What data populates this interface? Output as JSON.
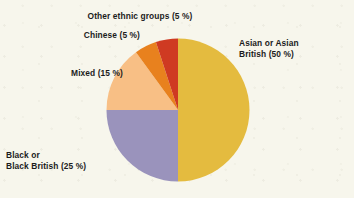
{
  "figure": {
    "background_color": "#f7f6ec"
  },
  "chart_data": {
    "type": "pie",
    "title": "",
    "subtitle": "",
    "xlabel": "",
    "ylabel": "",
    "grid": false,
    "legend_position": "none",
    "labels_position": "outside-callout",
    "start_angle_deg": 0,
    "direction": "clockwise",
    "units": "%",
    "total": 100,
    "categories": [
      "Asian or Asian British",
      "Black or Black British",
      "Mixed",
      "Chinese",
      "Other ethnic groups"
    ],
    "values": [
      50,
      25,
      15,
      5,
      5
    ],
    "colors": [
      "#e4bb3f",
      "#9a93bc",
      "#f8bf85",
      "#e8811e",
      "#cf3a22"
    ],
    "slices": [
      {
        "name": "Asian or Asian British",
        "value": 50,
        "color": "#e4bb3f",
        "label_line_1": "Asian or Asian",
        "label_line_2": "British (50 %)",
        "label_text": "Asian or Asian British (50 %)"
      },
      {
        "name": "Black or Black British",
        "value": 25,
        "color": "#9a93bc",
        "label_line_1": "Black or",
        "label_line_2": "Black British (25 %)",
        "label_text": "Black or Black British (25 %)"
      },
      {
        "name": "Mixed",
        "value": 15,
        "color": "#f8bf85",
        "label_line_1": "Mixed (15 %)",
        "label_line_2": "",
        "label_text": "Mixed (15 %)"
      },
      {
        "name": "Chinese",
        "value": 5,
        "color": "#e8811e",
        "label_line_1": "Chinese (5 %)",
        "label_line_2": "",
        "label_text": "Chinese (5 %)"
      },
      {
        "name": "Other ethnic groups",
        "value": 5,
        "color": "#cf3a22",
        "label_line_1": "Other ethnic groups (5 %)",
        "label_line_2": "",
        "label_text": "Other ethnic groups (5 %)"
      }
    ]
  }
}
